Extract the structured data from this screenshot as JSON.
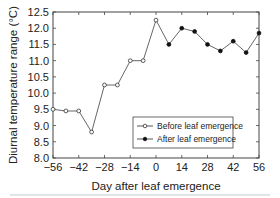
{
  "chart_data": {
    "type": "line",
    "title": "",
    "xlabel": "Day after leaf emergence",
    "ylabel": "Diurnal temperature range (°C)",
    "xlim": [
      -56,
      56
    ],
    "ylim": [
      8.0,
      12.5
    ],
    "xticks": [
      -56,
      -42,
      -28,
      -14,
      0,
      14,
      28,
      42,
      56
    ],
    "xtick_labels": [
      "−56",
      "−42",
      "−28",
      "−14",
      "0",
      "14",
      "28",
      "42",
      "56"
    ],
    "yticks": [
      8.0,
      8.5,
      9.0,
      9.5,
      10.0,
      10.5,
      11.0,
      11.5,
      12.0,
      12.5
    ],
    "ytick_labels": [
      "8.0",
      "8.5",
      "9.0",
      "9.5",
      "10.0",
      "10.5",
      "11.0",
      "11.5",
      "12.0",
      "12.5"
    ],
    "grid": false,
    "legend_position": "lower right",
    "series": [
      {
        "name": "Before leaf emergence",
        "marker": "open-circle",
        "x": [
          -56,
          -49,
          -42,
          -35,
          -28,
          -21,
          -14,
          -7,
          0
        ],
        "values": [
          9.5,
          9.45,
          9.45,
          8.8,
          10.25,
          10.25,
          11.0,
          11.0,
          12.25
        ]
      },
      {
        "name": "After leaf emergence",
        "marker": "filled-circle",
        "x": [
          0,
          7,
          14,
          21,
          28,
          35,
          42,
          49,
          56
        ],
        "values": [
          12.25,
          11.5,
          12.0,
          11.9,
          11.5,
          11.3,
          11.6,
          11.25,
          11.85
        ]
      }
    ]
  }
}
